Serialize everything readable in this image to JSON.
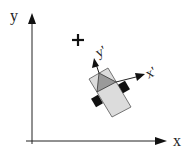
{
  "diagram": {
    "axes": {
      "x_label": "x",
      "y_label": "y"
    },
    "robot_frame": {
      "x_label": "x'",
      "y_label": "y'"
    },
    "origin_marker": "+",
    "colors": {
      "axis": "#111111",
      "body": "#dcdcdc",
      "triangle": "#9a9a9a",
      "wheel": "#111111"
    }
  }
}
